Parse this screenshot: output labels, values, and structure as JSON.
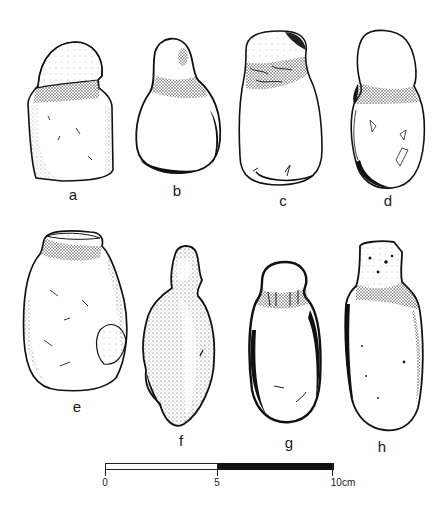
{
  "figure": {
    "artifacts": [
      {
        "id": "a",
        "label": "a"
      },
      {
        "id": "b",
        "label": "b"
      },
      {
        "id": "c",
        "label": "c"
      },
      {
        "id": "d",
        "label": "d"
      },
      {
        "id": "e",
        "label": "e"
      },
      {
        "id": "f",
        "label": "f"
      },
      {
        "id": "g",
        "label": "g"
      },
      {
        "id": "h",
        "label": "h"
      }
    ],
    "scale_bar": {
      "tick_0": "0",
      "tick_5": "5",
      "tick_10": "10cm",
      "segments": [
        {
          "from": 0,
          "to": 5,
          "fill": "#ffffff"
        },
        {
          "from": 5,
          "to": 10,
          "fill": "#111111"
        }
      ],
      "unit": "cm"
    },
    "colors": {
      "ink": "#111111",
      "paper": "#ffffff",
      "stipple": "#555555"
    }
  }
}
